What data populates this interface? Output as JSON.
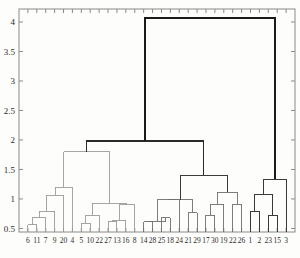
{
  "chart_data": {
    "type": "dendrogram",
    "title": "",
    "xlabel": "",
    "ylabel": "",
    "ylim": [
      0.44,
      4.22
    ],
    "yticks": [
      0.5,
      1,
      1.5,
      2,
      2.5,
      3,
      3.5,
      4
    ],
    "ytick_labels": [
      "0.5",
      "1",
      "1.5",
      "2",
      "2.5",
      "3",
      "3.5",
      "4"
    ],
    "grid": false,
    "legend": null,
    "leaf_order": [
      "6",
      "11",
      "7",
      "9",
      "20",
      "4",
      "5",
      "10",
      "22",
      "27",
      "13",
      "16",
      "8",
      "14",
      "28",
      "25",
      "18",
      "24",
      "21",
      "29",
      "17",
      "30",
      "19",
      "22",
      "26",
      "1",
      "2",
      "23",
      "15",
      "3"
    ],
    "leaf_labels": [
      "6",
      "11",
      "7",
      "9",
      "20",
      "4",
      "5",
      "10",
      "22",
      "27",
      "13",
      "16",
      "8",
      "14",
      "28",
      "25",
      "18",
      "24",
      "21",
      "29",
      "17",
      "30",
      "19",
      "22",
      "26",
      "1",
      "2",
      "23",
      "15",
      "3"
    ],
    "n_leaves": 30,
    "links": [
      {
        "id": "L1",
        "left": "6",
        "right": "11",
        "height": 0.56,
        "color": "#9b9b9b"
      },
      {
        "id": "L2",
        "left": "L1",
        "right": "7",
        "height": 0.68,
        "color": "#9b9b9b"
      },
      {
        "id": "L3",
        "left": "L2",
        "right": "9",
        "height": 0.79,
        "color": "#9b9b9b"
      },
      {
        "id": "L4",
        "left": "L3",
        "right": "20",
        "height": 1.06,
        "color": "#9b9b9b"
      },
      {
        "id": "L5",
        "left": "L4",
        "right": "4",
        "height": 1.2,
        "color": "#9b9b9b"
      },
      {
        "id": "L6",
        "left": "5",
        "right": "10",
        "height": 0.59,
        "color": "#9b9b9b"
      },
      {
        "id": "L7",
        "left": "L6",
        "right": "22",
        "height": 0.72,
        "color": "#9b9b9b"
      },
      {
        "id": "L8",
        "left": "27",
        "right": "13",
        "height": 0.62,
        "color": "#9b9b9b"
      },
      {
        "id": "L9",
        "left": "L8",
        "right": "16",
        "height": 0.64,
        "color": "#9b9b9b"
      },
      {
        "id": "L10",
        "left": "L9",
        "right": "8",
        "height": 0.9,
        "color": "#9b9b9b"
      },
      {
        "id": "L11",
        "left": "L7",
        "right": "L10",
        "height": 0.93,
        "color": "#9b9b9b"
      },
      {
        "id": "L12",
        "left": "L5",
        "right": "L11",
        "height": 1.8,
        "color": "#9b9b9b"
      },
      {
        "id": "L13",
        "left": "14",
        "right": "28",
        "height": 0.61,
        "color": "#6f6f6f"
      },
      {
        "id": "L14",
        "left": "25",
        "right": "18",
        "height": 0.68,
        "color": "#6f6f6f"
      },
      {
        "id": "L15",
        "left": "L13",
        "right": "L14",
        "height": 0.61,
        "color": "#6f6f6f"
      },
      {
        "id": "L16",
        "left": "L15",
        "right": "24",
        "height": 0.99,
        "color": "#6f6f6f"
      },
      {
        "id": "L17",
        "left": "21",
        "right": "29",
        "height": 0.77,
        "color": "#6f6f6f"
      },
      {
        "id": "L18",
        "left": "17",
        "right": "30",
        "height": 0.72,
        "color": "#6f6f6f"
      },
      {
        "id": "L19",
        "left": "L18",
        "right": "19",
        "height": 0.91,
        "color": "#6f6f6f"
      },
      {
        "id": "L20",
        "left": "22b",
        "right": "26",
        "height": 0.91,
        "color": "#6f6f6f"
      },
      {
        "id": "L21",
        "left": "L19",
        "right": "L20",
        "height": 1.11,
        "color": "#6f6f6f"
      },
      {
        "id": "L22",
        "left": "L16",
        "right": "L17",
        "height": 0.99,
        "color": "#6f6f6f"
      },
      {
        "id": "L23",
        "left": "L22",
        "right": "L21",
        "height": 1.4,
        "color": "#3a3a3a"
      },
      {
        "id": "L24",
        "left": "1",
        "right": "2",
        "height": 0.78,
        "color": "#3a3a3a"
      },
      {
        "id": "L25",
        "left": "23",
        "right": "15",
        "height": 0.72,
        "color": "#3a3a3a"
      },
      {
        "id": "L26",
        "left": "L24",
        "right": "L25",
        "height": 1.08,
        "color": "#3a3a3a"
      },
      {
        "id": "L27",
        "left": "L26",
        "right": "3",
        "height": 1.33,
        "color": "#3a3a3a"
      },
      {
        "id": "L28",
        "left": "L12",
        "right": "L23",
        "height": 1.98,
        "color": "#2a2a2a"
      },
      {
        "id": "L29",
        "left": "L28",
        "right": "L27",
        "height": 4.07,
        "color": "#1a1a1a"
      }
    ],
    "segments": [
      {
        "name": "root-merge",
        "y": 4.07,
        "x1": 152,
        "x2": 277,
        "width": 1.5,
        "color": "#1a1a1a"
      },
      {
        "name": "level2-merge",
        "y": 1.98,
        "x1": 105,
        "x2": 202,
        "width": 1.4,
        "color": "#2a2a2a"
      }
    ]
  },
  "axes": {
    "ytick_labels": [
      "4",
      "3.5",
      "3",
      "2.5",
      "2",
      "1.5",
      "1",
      "0.5"
    ],
    "ytick_values": [
      4,
      3.5,
      3,
      2.5,
      2,
      1.5,
      1,
      0.5
    ],
    "xtick_labels": [
      "6",
      "11",
      "7",
      "9",
      "20",
      "4",
      "5",
      "10",
      "22",
      "27",
      "13",
      "16",
      "8",
      "14",
      "28",
      "25",
      "18",
      "24",
      "21",
      "29",
      "17",
      "30",
      "19",
      "22",
      "26",
      "1",
      "2",
      "23",
      "15",
      "3"
    ]
  },
  "frame": {
    "left": 19,
    "right": 295,
    "top": 9,
    "bottom": 232,
    "border_color": "#8a8a8a"
  },
  "colors": {
    "background": "#fdfdfb",
    "frame": "#8a8a8a",
    "light_link": "#9b9b9b",
    "mid_link": "#6f6f6f",
    "dark_link": "#2a2a2a",
    "text": "#2b2b2b"
  }
}
